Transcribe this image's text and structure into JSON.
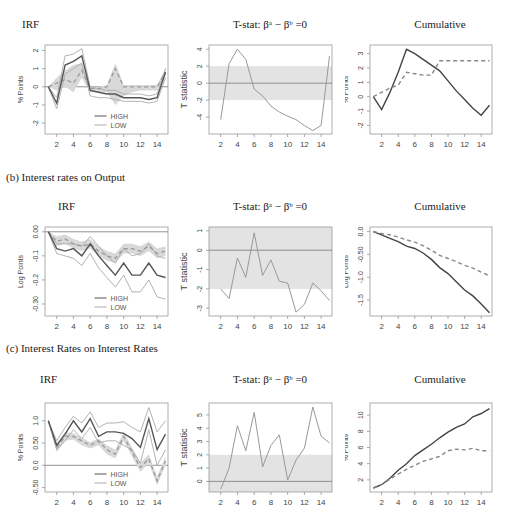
{
  "sections": [
    {
      "id": "a",
      "label": "",
      "titles": [
        "IRF",
        "T-stat: βᵃ − βᵇ =0",
        "Cumulative"
      ]
    },
    {
      "id": "b",
      "label": "(b)   Interest rates on Output",
      "titles": [
        "IRF",
        "T-stat: βᵃ − βᵇ =0",
        "Cumulative"
      ]
    },
    {
      "id": "c",
      "label": "(c)   Interest Rates on Interest Rates",
      "titles": [
        "IRF",
        "T-stat: βᵃ − βᵇ =0",
        "Cumulative"
      ]
    }
  ],
  "legend": {
    "high": "HIGH",
    "low": "LOW"
  },
  "chart_data": [
    {
      "panel": "a-irf",
      "type": "line",
      "title": "IRF",
      "xlabel": "",
      "ylabel": "% Points",
      "x": [
        1,
        2,
        3,
        4,
        5,
        6,
        7,
        8,
        9,
        10,
        11,
        12,
        13,
        14,
        15
      ],
      "xticks": [
        2,
        4,
        6,
        8,
        10,
        12,
        14
      ],
      "yticks": [
        -2,
        -1,
        0,
        1,
        2
      ],
      "ylim": [
        -2.6,
        2.3
      ],
      "series": [
        {
          "name": "HIGH",
          "values": [
            0,
            -0.9,
            1.2,
            1.4,
            1.7,
            -0.2,
            -0.3,
            -0.4,
            -0.4,
            -0.6,
            -0.6,
            -0.6,
            -0.7,
            -0.6,
            0.8
          ]
        },
        {
          "name": "HIGH upper",
          "values": [
            0,
            -0.6,
            1.7,
            1.8,
            2.1,
            0.0,
            -0.1,
            -0.2,
            -0.2,
            -0.4,
            -0.4,
            -0.4,
            -0.5,
            -0.4,
            1.0
          ]
        },
        {
          "name": "HIGH lower",
          "values": [
            0,
            -1.2,
            0.7,
            1.0,
            1.3,
            -0.5,
            -0.6,
            -0.6,
            -0.7,
            -0.8,
            -0.8,
            -0.8,
            -0.9,
            -0.8,
            0.5
          ]
        },
        {
          "name": "LOW",
          "values": [
            0,
            0.2,
            0.4,
            0.2,
            0.9,
            -0.1,
            -0.1,
            0.0,
            1.0,
            0.0,
            0.0,
            0.0,
            0.0,
            0.0,
            0.8
          ]
        },
        {
          "name": "LOW upper",
          "values": [
            0,
            0.5,
            0.9,
            1.2,
            1.3,
            0.0,
            0.0,
            0.1,
            1.3,
            0.1,
            0.1,
            0.1,
            0.1,
            0.1,
            1.0
          ]
        },
        {
          "name": "LOW lower",
          "values": [
            0,
            -0.2,
            0.0,
            -0.3,
            0.5,
            -0.3,
            -0.3,
            -0.3,
            -1.0,
            -0.5,
            -0.3,
            -0.2,
            -0.2,
            -0.2,
            0.6
          ]
        }
      ],
      "legend": [
        "HIGH",
        "LOW"
      ],
      "legend_position": "bottom-center",
      "hline": 0
    },
    {
      "panel": "a-tstat",
      "type": "line",
      "title": "T-stat: βa − βb =0",
      "ylabel": "T statistic",
      "x": [
        2,
        3,
        4,
        5,
        6,
        7,
        8,
        9,
        10,
        11,
        12,
        13,
        14,
        15
      ],
      "xticks": [
        2,
        4,
        6,
        8,
        10,
        12,
        14
      ],
      "yticks": [
        -4,
        -2,
        0,
        2,
        4
      ],
      "ylim": [
        -6,
        4.5
      ],
      "values": [
        -4.3,
        2.3,
        4.0,
        2.8,
        -0.7,
        -1.5,
        -2.7,
        -3.4,
        -3.9,
        -4.3,
        -5.0,
        -5.6,
        -5.0,
        3.2
      ],
      "band": [
        -2,
        2
      ],
      "hline": 0
    },
    {
      "panel": "a-cum",
      "type": "line",
      "title": "Cumulative",
      "ylabel": "% Points",
      "x": [
        1,
        2,
        3,
        4,
        5,
        6,
        7,
        8,
        9,
        10,
        11,
        12,
        13,
        14,
        15
      ],
      "xticks": [
        2,
        4,
        6,
        8,
        10,
        12,
        14
      ],
      "yticks": [
        -2,
        -1,
        0,
        1,
        2,
        3
      ],
      "ylim": [
        -2.6,
        3.6
      ],
      "series": [
        {
          "name": "HIGH",
          "style": "solid",
          "values": [
            0,
            -0.9,
            0.3,
            1.7,
            3.3,
            3.0,
            2.6,
            2.2,
            1.8,
            1.1,
            0.4,
            -0.2,
            -0.8,
            -1.3,
            -0.6
          ]
        },
        {
          "name": "LOW",
          "style": "dashed",
          "values": [
            0,
            0.3,
            0.6,
            0.8,
            1.7,
            1.6,
            1.5,
            1.5,
            2.5,
            2.5,
            2.5,
            2.5,
            2.5,
            2.5,
            2.5
          ]
        }
      ]
    },
    {
      "panel": "b-irf",
      "type": "line",
      "title": "IRF",
      "ylabel": "Log Points",
      "x": [
        1,
        2,
        3,
        4,
        5,
        6,
        7,
        8,
        9,
        10,
        11,
        12,
        13,
        14,
        15
      ],
      "xticks": [
        2,
        4,
        6,
        8,
        10,
        12,
        14
      ],
      "yticks": [
        0.0,
        -0.1,
        -0.2,
        -0.3
      ],
      "ylim": [
        -0.35,
        0.02
      ],
      "series": [
        {
          "name": "HIGH",
          "values": [
            0,
            -0.07,
            -0.08,
            -0.07,
            -0.1,
            -0.05,
            -0.1,
            -0.14,
            -0.18,
            -0.13,
            -0.18,
            -0.18,
            -0.13,
            -0.18,
            -0.19
          ]
        },
        {
          "name": "HIGH upper",
          "values": [
            0,
            -0.05,
            -0.05,
            -0.05,
            -0.06,
            -0.02,
            -0.06,
            -0.1,
            -0.13,
            -0.07,
            -0.1,
            -0.09,
            -0.05,
            -0.1,
            -0.11
          ]
        },
        {
          "name": "HIGH lower",
          "values": [
            0,
            -0.09,
            -0.1,
            -0.11,
            -0.14,
            -0.09,
            -0.15,
            -0.19,
            -0.23,
            -0.18,
            -0.25,
            -0.25,
            -0.2,
            -0.27,
            -0.28
          ]
        },
        {
          "name": "LOW",
          "values": [
            0,
            -0.04,
            -0.03,
            -0.05,
            -0.06,
            -0.05,
            -0.08,
            -0.1,
            -0.11,
            -0.07,
            -0.07,
            -0.08,
            -0.06,
            -0.09,
            -0.08
          ]
        },
        {
          "name": "LOW upper",
          "values": [
            0,
            -0.02,
            -0.01,
            -0.03,
            -0.04,
            -0.03,
            -0.06,
            -0.08,
            -0.09,
            -0.05,
            -0.05,
            -0.06,
            -0.04,
            -0.07,
            -0.06
          ]
        },
        {
          "name": "LOW lower",
          "values": [
            0,
            -0.06,
            -0.05,
            -0.07,
            -0.08,
            -0.07,
            -0.1,
            -0.12,
            -0.13,
            -0.09,
            -0.09,
            -0.1,
            -0.08,
            -0.11,
            -0.1
          ]
        }
      ],
      "legend": [
        "HIGH",
        "LOW"
      ],
      "hline": 0
    },
    {
      "panel": "b-tstat",
      "type": "line",
      "title": "T-stat: βa − βb =0",
      "ylabel": "T statistic",
      "x": [
        2,
        3,
        4,
        5,
        6,
        7,
        8,
        9,
        10,
        11,
        12,
        13,
        14,
        15
      ],
      "xticks": [
        2,
        4,
        6,
        8,
        10,
        12,
        14
      ],
      "yticks": [
        -3,
        -2,
        -1,
        0,
        1
      ],
      "ylim": [
        -3.4,
        1.2
      ],
      "values": [
        -2.0,
        -2.5,
        -0.4,
        -1.4,
        0.9,
        -1.3,
        -0.5,
        -1.6,
        -1.7,
        -3.2,
        -2.8,
        -1.7,
        -2.1,
        -2.6
      ],
      "band": [
        -2,
        2
      ],
      "hline": 0
    },
    {
      "panel": "b-cum",
      "type": "line",
      "title": "Cumulative",
      "ylabel": "Log Points",
      "x": [
        1,
        2,
        3,
        4,
        5,
        6,
        7,
        8,
        9,
        10,
        11,
        12,
        13,
        14,
        15
      ],
      "xticks": [
        2,
        4,
        6,
        8,
        10,
        12,
        14
      ],
      "yticks": [
        0.0,
        -0.5,
        -1.0,
        -1.5
      ],
      "ylim": [
        -1.85,
        0.1
      ],
      "series": [
        {
          "name": "HIGH",
          "style": "solid",
          "values": [
            0,
            -0.07,
            -0.15,
            -0.22,
            -0.32,
            -0.37,
            -0.47,
            -0.61,
            -0.79,
            -0.92,
            -1.1,
            -1.28,
            -1.41,
            -1.59,
            -1.78
          ]
        },
        {
          "name": "LOW",
          "style": "dashed",
          "values": [
            0,
            -0.04,
            -0.07,
            -0.12,
            -0.18,
            -0.23,
            -0.31,
            -0.41,
            -0.52,
            -0.59,
            -0.66,
            -0.74,
            -0.8,
            -0.89,
            -0.97
          ]
        }
      ]
    },
    {
      "panel": "c-irf",
      "type": "line",
      "title": "IRF",
      "ylabel": "% Points",
      "x": [
        1,
        2,
        3,
        4,
        5,
        6,
        7,
        8,
        9,
        10,
        11,
        12,
        13,
        14,
        15
      ],
      "xticks": [
        2,
        4,
        6,
        8,
        10,
        12,
        14
      ],
      "yticks": [
        -0.5,
        0.0,
        0.5,
        1.0
      ],
      "ylim": [
        -0.6,
        1.4
      ],
      "series": [
        {
          "name": "HIGH",
          "values": [
            1.0,
            0.45,
            0.7,
            1.0,
            0.75,
            1.05,
            0.65,
            0.75,
            0.75,
            0.72,
            0.6,
            0.4,
            1.05,
            0.35,
            0.7
          ]
        },
        {
          "name": "HIGH upper",
          "values": [
            1.0,
            0.55,
            0.85,
            1.1,
            0.95,
            1.2,
            0.85,
            0.95,
            0.95,
            0.98,
            0.85,
            0.75,
            1.3,
            0.75,
            1.0
          ]
        },
        {
          "name": "HIGH lower",
          "values": [
            1.0,
            0.35,
            0.55,
            0.8,
            0.6,
            0.85,
            0.5,
            0.55,
            0.55,
            0.45,
            0.35,
            0.05,
            0.8,
            0.0,
            0.35
          ]
        },
        {
          "name": "LOW",
          "values": [
            1.0,
            0.4,
            0.65,
            0.65,
            0.55,
            0.45,
            0.55,
            0.35,
            0.25,
            0.65,
            0.3,
            -0.05,
            0.15,
            -0.35,
            0.1
          ]
        },
        {
          "name": "LOW upper",
          "values": [
            1.0,
            0.5,
            0.75,
            0.72,
            0.62,
            0.52,
            0.6,
            0.45,
            0.35,
            0.75,
            0.4,
            0.05,
            0.25,
            -0.25,
            0.2
          ]
        },
        {
          "name": "LOW lower",
          "values": [
            1.0,
            0.3,
            0.55,
            0.58,
            0.45,
            0.38,
            0.45,
            0.25,
            0.15,
            0.55,
            0.2,
            -0.15,
            0.05,
            -0.45,
            0.0
          ]
        }
      ],
      "legend": [
        "HIGH",
        "LOW"
      ],
      "hline": 0
    },
    {
      "panel": "c-tstat",
      "type": "line",
      "title": "T-stat: βa − βb =0",
      "ylabel": "T statistic",
      "x": [
        2,
        3,
        4,
        5,
        6,
        7,
        8,
        9,
        10,
        11,
        12,
        13,
        14,
        15
      ],
      "xticks": [
        2,
        4,
        6,
        8,
        10,
        12,
        14
      ],
      "yticks": [
        0,
        1,
        2,
        3,
        4,
        5
      ],
      "ylim": [
        -0.8,
        5.9
      ],
      "values": [
        -0.6,
        1.0,
        4.2,
        2.3,
        5.2,
        1.1,
        2.7,
        3.5,
        0.1,
        1.6,
        2.5,
        5.6,
        3.4,
        2.9
      ],
      "band": [
        -2,
        2
      ],
      "hline": 0
    },
    {
      "panel": "c-cum",
      "type": "line",
      "title": "Cumulative",
      "ylabel": "% Points",
      "x": [
        1,
        2,
        3,
        4,
        5,
        6,
        7,
        8,
        9,
        10,
        11,
        12,
        13,
        14,
        15
      ],
      "xticks": [
        2,
        4,
        6,
        8,
        10,
        12,
        14
      ],
      "yticks": [
        2,
        4,
        6,
        8,
        10
      ],
      "ylim": [
        0.5,
        11.5
      ],
      "series": [
        {
          "name": "HIGH",
          "style": "solid",
          "values": [
            1.0,
            1.4,
            2.2,
            3.2,
            4.0,
            5.0,
            5.7,
            6.4,
            7.2,
            7.9,
            8.5,
            8.9,
            9.8,
            10.2,
            10.8
          ]
        },
        {
          "name": "LOW",
          "style": "dashed",
          "values": [
            1.0,
            1.4,
            2.1,
            2.7,
            3.3,
            3.8,
            4.3,
            4.6,
            4.9,
            5.6,
            5.8,
            5.7,
            5.9,
            5.6,
            5.6
          ]
        }
      ]
    }
  ]
}
